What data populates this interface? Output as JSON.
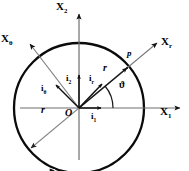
{
  "figure": {
    "type": "polar-coordinate-diagram",
    "background_color": "#ffffff",
    "stroke_color": "#000000",
    "ray_color": "#555555",
    "circle": {
      "cx": 79,
      "cy": 108,
      "r": 65,
      "stroke_width": 2.2
    },
    "origin_label": "O"
  },
  "axes": [
    {
      "name": "x1-axis",
      "label": "X",
      "sub": "1",
      "angle_deg": 0,
      "label_x": 166,
      "label_y": 113,
      "tip_x": 185,
      "tip_y": 108
    },
    {
      "name": "x2-axis",
      "label": "X",
      "sub": "2",
      "angle_deg": 90,
      "label_x": 58,
      "label_y": 3,
      "tip_x": 79,
      "tip_y": 12
    },
    {
      "name": "xr-axis",
      "label": "X",
      "sub": "r",
      "angle_deg": 40,
      "label_x": 160,
      "label_y": 43,
      "tip_x": 156,
      "tip_y": 43
    },
    {
      "name": "xtheta-axis",
      "label": "X",
      "sub": "θ",
      "angle_deg": 131,
      "label_x": 2,
      "label_y": 40,
      "tip_x": 31,
      "tip_y": 45
    }
  ],
  "vectors": [
    {
      "name": "unit-vector-i1",
      "label": "i",
      "sub": "1",
      "label_x": 94,
      "label_y": 117,
      "tip_x": 103,
      "tip_y": 108
    },
    {
      "name": "unit-vector-i2",
      "label": "i",
      "sub": "2",
      "label_x": 69,
      "label_y": 78,
      "tip_x": 79,
      "tip_y": 73
    },
    {
      "name": "unit-vector-ir",
      "label": "i",
      "sub": "r",
      "label_x": 92,
      "label_y": 78,
      "tip_x": 104,
      "tip_y": 82
    },
    {
      "name": "unit-vector-itheta",
      "label": "i",
      "sub": "θ",
      "label_x": 44,
      "label_y": 88,
      "tip_x": 54,
      "tip_y": 83
    }
  ],
  "annotations": [
    {
      "name": "point-p-label",
      "text": "p",
      "x": 129,
      "y": 54
    },
    {
      "name": "position-vector-r-label",
      "text": "r",
      "x": 105,
      "y": 69
    },
    {
      "name": "radius-r-label",
      "text": "r",
      "x": 42,
      "y": 110
    },
    {
      "name": "angle-theta-label",
      "text": "ϑ",
      "x": 121,
      "y": 85
    },
    {
      "name": "origin-label",
      "text": "O",
      "x": 67,
      "y": 111
    }
  ],
  "point_p": {
    "x": 128,
    "y": 67
  },
  "angle_arc": {
    "radius": 28,
    "start_deg": 0,
    "end_deg": 40
  }
}
